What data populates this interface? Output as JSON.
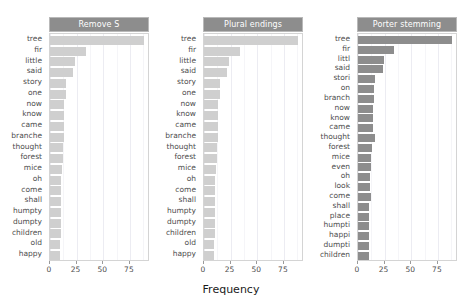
{
  "chart_data": {
    "type": "bar",
    "orientation": "horizontal",
    "title": "",
    "xlabel": "Frequency",
    "ylabel": "",
    "xlim": [
      0,
      92
    ],
    "xticks": [
      0,
      25,
      50,
      75
    ],
    "grid": true,
    "legend": null,
    "facets": [
      {
        "title": "Remove S",
        "bar_color": "#cfcfcf",
        "categories": [
          "tree",
          "fir",
          "little",
          "said",
          "story",
          "one",
          "now",
          "know",
          "came",
          "branche",
          "thought",
          "forest",
          "mice",
          "oh",
          "come",
          "shall",
          "humpty",
          "dumpty",
          "children",
          "old",
          "happy"
        ],
        "values": [
          88,
          34,
          23,
          22,
          15,
          15,
          13,
          13,
          13,
          13,
          12,
          12,
          11,
          10,
          10,
          10,
          10,
          10,
          10,
          9,
          9
        ]
      },
      {
        "title": "Plural endings",
        "bar_color": "#cfcfcf",
        "categories": [
          "tree",
          "fir",
          "little",
          "said",
          "story",
          "one",
          "now",
          "know",
          "came",
          "branche",
          "thought",
          "forest",
          "mice",
          "oh",
          "come",
          "shall",
          "humpty",
          "dumpty",
          "children",
          "old",
          "happy"
        ],
        "values": [
          88,
          34,
          23,
          22,
          15,
          15,
          13,
          13,
          13,
          13,
          12,
          12,
          11,
          10,
          10,
          10,
          10,
          10,
          10,
          9,
          9
        ]
      },
      {
        "title": "Porter stemming",
        "bar_color": "#8d8d8d",
        "categories": [
          "tree",
          "fir",
          "littl",
          "said",
          "stori",
          "on",
          "branch",
          "now",
          "know",
          "came",
          "thought",
          "forest",
          "mice",
          "even",
          "oh",
          "look",
          "come",
          "shall",
          "place",
          "humpti",
          "happi",
          "dumpti",
          "children"
        ],
        "values": [
          88,
          34,
          24,
          23,
          16,
          15,
          15,
          14,
          14,
          14,
          16,
          13,
          12,
          12,
          11,
          11,
          12,
          10,
          10,
          10,
          10,
          10,
          10
        ]
      }
    ]
  },
  "axis": {
    "xlabel": "Frequency",
    "tick_labels": [
      "0",
      "25",
      "50",
      "75"
    ]
  }
}
